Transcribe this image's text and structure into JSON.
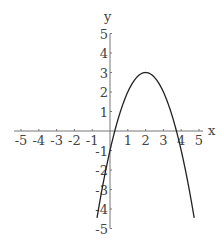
{
  "chart_data": {
    "type": "line",
    "title": "",
    "xlabel": "x",
    "ylabel": "y",
    "xlim": [
      -5,
      5
    ],
    "ylim": [
      -5,
      5
    ],
    "grid": false,
    "x_ticks": [
      "-5",
      "-4",
      "-3",
      "-2",
      "-1",
      "1",
      "2",
      "3",
      "4",
      "5"
    ],
    "y_ticks": [
      "5",
      "4",
      "3",
      "2",
      "1",
      "-1",
      "-2",
      "-3",
      "-4",
      "-5"
    ],
    "series": [
      {
        "name": "y = -x^2 + 4x - 1",
        "x": [
          -0.73,
          -0.5,
          0,
          0.27,
          0.5,
          1,
          1.5,
          2,
          2.5,
          3,
          3.5,
          3.73,
          4,
          4.5,
          4.73
        ],
        "y": [
          -5,
          -3.25,
          -1,
          0,
          0.75,
          2,
          2.75,
          3,
          2.75,
          2,
          0.75,
          0,
          -1,
          -3.25,
          -5
        ]
      }
    ],
    "annotations": []
  },
  "colors": {
    "axis": "#777777",
    "curve": "#222222",
    "text": "#444444"
  }
}
